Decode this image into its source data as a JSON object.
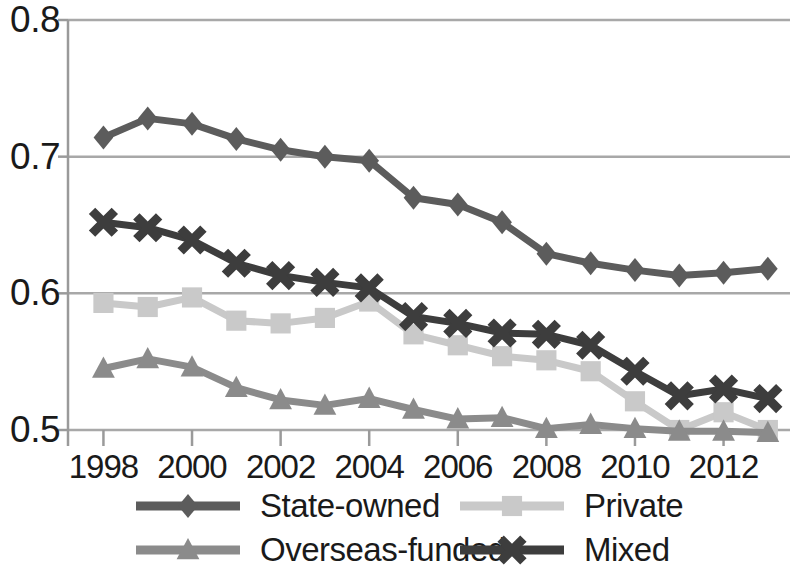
{
  "chart_data": {
    "type": "line",
    "title": "",
    "xlabel": "",
    "ylabel": "",
    "xlim": [
      1997.2,
      2013.5
    ],
    "ylim": [
      0.5,
      0.8
    ],
    "grid": true,
    "legend_position": "bottom",
    "x": [
      1998,
      1999,
      2000,
      2001,
      2002,
      2003,
      2004,
      2005,
      2006,
      2007,
      2008,
      2009,
      2010,
      2011,
      2012,
      2013
    ],
    "x_tick_labels": [
      "1998",
      "2000",
      "2002",
      "2004",
      "2006",
      "2008",
      "2010",
      "2012"
    ],
    "x_ticks": [
      1998,
      2000,
      2002,
      2004,
      2006,
      2008,
      2010,
      2012
    ],
    "y_tick_labels": [
      "0.8",
      "0.7",
      "0.6",
      "0.5"
    ],
    "y_ticks": [
      0.8,
      0.7,
      0.6,
      0.5
    ],
    "series": [
      {
        "name": "State-owned",
        "marker": "diamond",
        "color": "#5c5c5c",
        "values": [
          0.714,
          0.728,
          0.724,
          0.713,
          0.705,
          0.7,
          0.697,
          0.67,
          0.665,
          0.652,
          0.629,
          0.622,
          0.617,
          0.613,
          0.615,
          0.618
        ]
      },
      {
        "name": "Private",
        "marker": "square",
        "color": "#c9c9c9",
        "values": [
          0.593,
          0.59,
          0.597,
          0.58,
          0.578,
          0.582,
          0.594,
          0.57,
          0.562,
          0.554,
          0.551,
          0.543,
          0.521,
          0.5,
          0.513,
          0.5
        ]
      },
      {
        "name": "Overseas-funded",
        "marker": "triangle",
        "color": "#8b8b8b",
        "values": [
          0.545,
          0.552,
          0.546,
          0.531,
          0.522,
          0.518,
          0.523,
          0.515,
          0.508,
          0.509,
          0.501,
          0.504,
          0.501,
          0.499,
          0.499,
          0.498
        ]
      },
      {
        "name": "Mixed",
        "marker": "cross",
        "color": "#3d3d3d",
        "values": [
          0.652,
          0.648,
          0.639,
          0.622,
          0.613,
          0.608,
          0.604,
          0.583,
          0.578,
          0.571,
          0.57,
          0.562,
          0.543,
          0.525,
          0.53,
          0.523
        ]
      }
    ]
  },
  "axis": {
    "line_color": "#9a9a9a",
    "grid_color": "#a8a8a8"
  }
}
